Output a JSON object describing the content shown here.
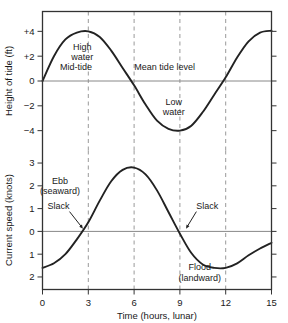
{
  "chart_data": [
    {
      "type": "line",
      "title": "",
      "xlabel": "Time (hours, lunar)",
      "ylabel": "Height of tide (ft)",
      "xlim": [
        0,
        15
      ],
      "ylim": [
        -5.6,
        5.6
      ],
      "xticks": [
        "0",
        "3",
        "6",
        "9",
        "12",
        "15"
      ],
      "xtick_values": [
        0,
        3,
        6,
        9,
        12,
        15
      ],
      "yticks": [
        "+4",
        "+2",
        "0",
        "−2",
        "−4"
      ],
      "ytick_values": [
        4,
        2,
        0,
        -2,
        -4
      ],
      "grid": "vertical dashed at x = 3, 6, 9, 12",
      "zero_line": true,
      "series": [
        {
          "name": "Height of tide",
          "x": [
            0,
            0.75,
            1.5,
            2.25,
            3,
            3.75,
            4.5,
            5.25,
            6,
            6.75,
            7.5,
            8.25,
            9,
            9.75,
            10.5,
            11.25,
            12,
            12.75,
            13.5,
            14.25,
            15
          ],
          "values": [
            0,
            2.0,
            3.35,
            3.9,
            4.0,
            3.55,
            2.45,
            1.05,
            -0.35,
            -1.9,
            -3.2,
            -3.85,
            -4.0,
            -3.6,
            -2.5,
            -1.1,
            0.3,
            1.9,
            3.2,
            3.9,
            4.05
          ]
        }
      ],
      "annotations": [
        {
          "text_lines": [
            "High",
            "water"
          ],
          "x": 2.6,
          "y": 2.5
        },
        {
          "text_lines": [
            "Mid-tide"
          ],
          "x": 2.2,
          "y": 0.85
        },
        {
          "text_lines": [
            "Mean tide level"
          ],
          "x": 8.0,
          "y": 0.85
        },
        {
          "text_lines": [
            "Low",
            "water"
          ],
          "x": 8.6,
          "y": -1.9
        }
      ]
    },
    {
      "type": "line",
      "title": "",
      "xlabel": "Time (hours, lunar)",
      "ylabel": "Current speed (knots)",
      "xlim": [
        0,
        15
      ],
      "ylim": [
        -2.55,
        3.55
      ],
      "xticks": [
        "0",
        "3",
        "6",
        "9",
        "12",
        "15"
      ],
      "xtick_values": [
        0,
        3,
        6,
        9,
        12,
        15
      ],
      "yticks": [
        "3",
        "2",
        "1",
        "0",
        "1",
        "2"
      ],
      "ytick_values": [
        3,
        2,
        1,
        0,
        -1,
        -2
      ],
      "grid": "vertical dashed at x = 3, 6, 9, 12",
      "zero_line": true,
      "series": [
        {
          "name": "Current speed",
          "x": [
            0,
            0.75,
            1.5,
            2.25,
            3,
            3.75,
            4.5,
            5.25,
            6,
            6.75,
            7.5,
            8.25,
            9,
            9.75,
            10.5,
            11.25,
            12,
            12.75,
            13.5,
            14.25,
            15
          ],
          "values": [
            -1.6,
            -1.4,
            -1.0,
            -0.35,
            0.4,
            1.35,
            2.2,
            2.7,
            2.8,
            2.5,
            1.8,
            0.85,
            -0.1,
            -0.95,
            -1.45,
            -1.6,
            -1.6,
            -1.4,
            -1.05,
            -0.75,
            -0.5
          ]
        }
      ],
      "annotations": [
        {
          "text_lines": [
            "Ebb",
            "(seaward)"
          ],
          "x": 1.15,
          "y": 2.1
        },
        {
          "text_lines": [
            "Slack"
          ],
          "x": 1.05,
          "y": 1.0,
          "arrow_to_x": 2.65,
          "arrow_to_y": 0.12
        },
        {
          "text_lines": [
            "Slack"
          ],
          "x": 10.8,
          "y": 1.0,
          "arrow_to_x": 9.4,
          "arrow_to_y": 0.12
        },
        {
          "text_lines": [
            "Flood",
            "(landward)"
          ],
          "x": 10.3,
          "y": -1.7
        }
      ]
    }
  ],
  "figure": {
    "frame_color": "#333333",
    "curve_color": "#222222",
    "grid_color": "#999999",
    "zero_line_color": "#888888",
    "background": "#ffffff"
  }
}
